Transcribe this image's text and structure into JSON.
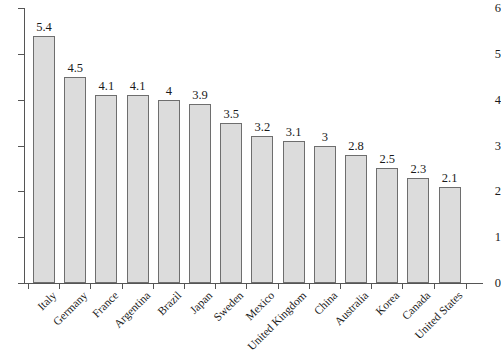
{
  "chart_data": {
    "type": "bar",
    "title": "",
    "xlabel": "",
    "ylabel": "",
    "ylim": [
      0,
      6
    ],
    "yticks": [
      0,
      1,
      2,
      3,
      4,
      5,
      6
    ],
    "ytick_labels": [
      "0",
      "1",
      "2",
      "3",
      "4",
      "5",
      "6"
    ],
    "grid": false,
    "legend": false,
    "bar_fill_color": "#dcdcdc",
    "bar_edge_color": "#6e6e6e",
    "categories": [
      "Italy",
      "Germany",
      "France",
      "Argentina",
      "Brazil",
      "Japan",
      "Sweden",
      "Mexico",
      "United Kingdom",
      "China",
      "Australia",
      "Korea",
      "Canada",
      "United States"
    ],
    "values": [
      5.4,
      4.5,
      4.1,
      4.1,
      4,
      3.9,
      3.5,
      3.2,
      3.1,
      3,
      2.8,
      2.5,
      2.3,
      2.1
    ],
    "value_labels": [
      "5.4",
      "4.5",
      "4.1",
      "4.1",
      "4",
      "3.9",
      "3.5",
      "3.2",
      "3.1",
      "3",
      "2.8",
      "2.5",
      "2.3",
      "2.1"
    ]
  }
}
